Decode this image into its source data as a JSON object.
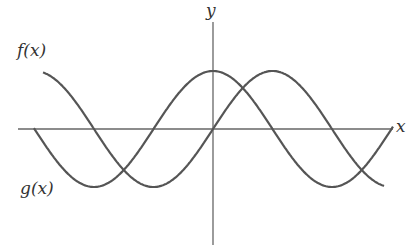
{
  "diagram": {
    "title": "",
    "axes": {
      "x_label": "x",
      "y_label": "y",
      "origin_px": [
        213,
        129
      ],
      "x_range_px": [
        18,
        393
      ],
      "y_range_px": [
        22,
        245
      ]
    },
    "curves": [
      {
        "name": "f(x)",
        "label": "f(x)",
        "shape": "cosine",
        "amplitude_px": 58,
        "period_px": 238,
        "x_start_px": 34,
        "x_end_px": 393
      },
      {
        "name": "g(x)",
        "label": "g(x)",
        "shape": "sine",
        "amplitude_px": 58,
        "period_px": 238,
        "x_start_px": 43,
        "x_end_px": 384
      }
    ],
    "colors": {
      "curve": "#555555",
      "axis": "#666666",
      "label": "#333333"
    }
  }
}
